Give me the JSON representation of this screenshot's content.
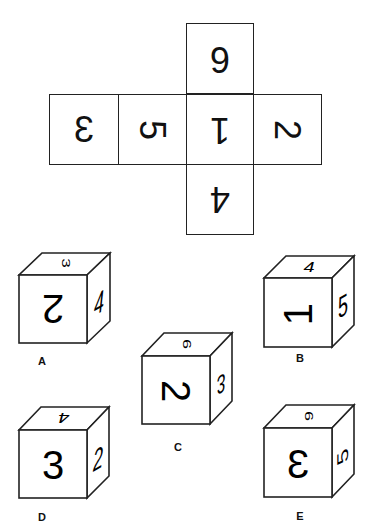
{
  "net": {
    "cells": [
      {
        "pos": "top",
        "value": "6",
        "rotation": 180,
        "mirror": false
      },
      {
        "pos": "left2",
        "value": "3",
        "rotation": 180,
        "mirror": true
      },
      {
        "pos": "left1",
        "value": "5",
        "rotation": 90,
        "mirror": false
      },
      {
        "pos": "center",
        "value": "1",
        "rotation": 180,
        "mirror": false
      },
      {
        "pos": "right",
        "value": "2",
        "rotation": 90,
        "mirror": false
      },
      {
        "pos": "bottom",
        "value": "4",
        "rotation": 180,
        "mirror": false
      }
    ]
  },
  "options": [
    {
      "label": "A",
      "front": "2",
      "top": "3",
      "right": "4"
    },
    {
      "label": "B",
      "front": "1",
      "top": "4",
      "right": "5"
    },
    {
      "label": "C",
      "front": "2",
      "top": "6",
      "right": "3"
    },
    {
      "label": "D",
      "front": "3",
      "top": "4",
      "right": "2"
    },
    {
      "label": "E",
      "front": "3",
      "top": "6",
      "right": "5"
    }
  ]
}
